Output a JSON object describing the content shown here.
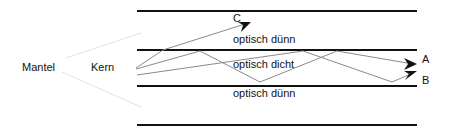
{
  "labels": {
    "mantel": "Mantel",
    "kern": "Kern",
    "top_cladding": "optisch dünn",
    "core": "optisch dicht",
    "bottom_cladding": "optisch dünn"
  },
  "rays": {
    "a": "A",
    "b": "B",
    "c": "C"
  },
  "colors": {
    "boundary": "#111111",
    "ray": "#8a8a8a",
    "mantel_guide": "#e4e4e4",
    "arrow": "#111111"
  }
}
